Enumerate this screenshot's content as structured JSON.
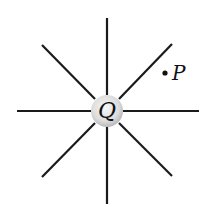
{
  "diagram": {
    "charge": {
      "label": "Q",
      "center": [
        107,
        111
      ],
      "radius": 16,
      "fill_center": "#f4f4f4",
      "fill_edge": "#bdbdbd"
    },
    "point": {
      "label": "P",
      "dot": [
        165,
        73
      ]
    },
    "field_lines": [
      {
        "dir": "up",
        "x1": 107,
        "y1": 95,
        "x2": 107,
        "y2": 18
      },
      {
        "dir": "down",
        "x1": 107,
        "y1": 127,
        "x2": 107,
        "y2": 204
      },
      {
        "dir": "left",
        "x1": 91,
        "y1": 111,
        "x2": 17,
        "y2": 111
      },
      {
        "dir": "right",
        "x1": 123,
        "y1": 111,
        "x2": 199,
        "y2": 111
      },
      {
        "dir": "up-left",
        "x1": 95,
        "y1": 99,
        "x2": 42,
        "y2": 45
      },
      {
        "dir": "up-right",
        "x1": 119,
        "y1": 99,
        "x2": 172,
        "y2": 44
      },
      {
        "dir": "down-left",
        "x1": 95,
        "y1": 123,
        "x2": 42,
        "y2": 177
      },
      {
        "dir": "down-right",
        "x1": 119,
        "y1": 123,
        "x2": 172,
        "y2": 176
      }
    ],
    "line_color": "#1a1a1a"
  }
}
